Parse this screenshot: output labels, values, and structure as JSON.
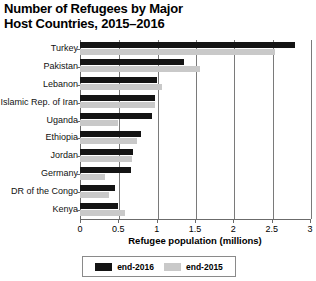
{
  "title": {
    "line1": "Number of Refugees by Major",
    "line2": "Host Countries, 2015–2016"
  },
  "legend": {
    "items": [
      {
        "label": "end-2016",
        "color": "#141414"
      },
      {
        "label": "end-2015",
        "color": "#c9c9c9"
      }
    ]
  },
  "chart_data": {
    "type": "bar",
    "orientation": "horizontal",
    "title": "Number of Refugees by Major Host Countries, 2015–2016",
    "xlabel": "Refugee  population (millions)",
    "ylabel": "",
    "xlim": [
      0,
      3
    ],
    "xticks": [
      0,
      0.5,
      1,
      1.5,
      2,
      2.5,
      3
    ],
    "xticklabels": [
      "0",
      "0.5",
      "1",
      "1.5",
      "2",
      "2.5",
      "3"
    ],
    "grid": true,
    "legend_position": "bottom",
    "categories": [
      "Turkey",
      "Pakistan",
      "Lebanon",
      "Islamic Rep. of Iran",
      "Uganda",
      "Ethiopia",
      "Jordan",
      "Germany",
      "DR of the Congo",
      "Kenya"
    ],
    "series": [
      {
        "name": "end-2016",
        "color": "#141414",
        "values": [
          2.8,
          1.35,
          1.01,
          0.98,
          0.94,
          0.79,
          0.69,
          0.67,
          0.45,
          0.49
        ]
      },
      {
        "name": "end-2015",
        "color": "#c9c9c9",
        "values": [
          2.54,
          1.56,
          1.07,
          0.98,
          0.5,
          0.74,
          0.68,
          0.32,
          0.38,
          0.59
        ]
      }
    ]
  }
}
